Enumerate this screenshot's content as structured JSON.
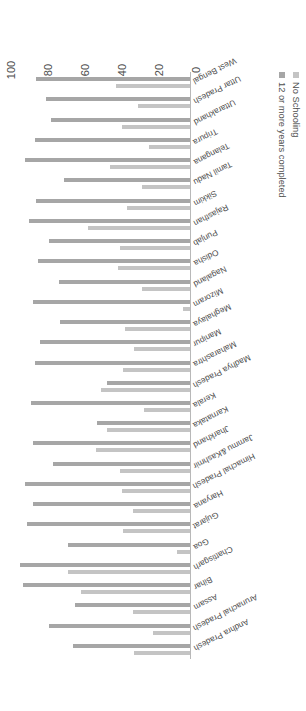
{
  "chart_data": {
    "type": "bar",
    "orientation": "horizontal",
    "title": "",
    "subtitle": "",
    "xlabel": "",
    "ylabel": "",
    "xlim": [
      0,
      100
    ],
    "ticks": [
      "0",
      "20",
      "40",
      "60",
      "80",
      "100"
    ],
    "tick_values": [
      0,
      20,
      40,
      60,
      80,
      100
    ],
    "grid": false,
    "legend_position": "bottom-left",
    "categories": [
      "Andhra Pradesh",
      "Arunachal Pradesh",
      "Assam",
      "Bihar",
      "Chattisgarh",
      "Goa",
      "Gujarat",
      "Haryana",
      "Himachal Pradesh",
      "Jammu &Kashmir",
      "Jharkhand",
      "Karnataka",
      "Kerala",
      "Madhya Pradesh",
      "Maharashtra",
      "Manipur",
      "Meghalaya",
      "Mizoram",
      "Nagaland",
      "Odisha",
      "Punjab",
      "Rajasthan",
      "Sikkim",
      "Tamil Nadu",
      "Telangana",
      "Tripura",
      "Uttarakhand",
      "Uttar Pradesh",
      "West Bengal"
    ],
    "series": [
      {
        "name": "No Schooling",
        "color": "#c4c4c4",
        "values": [
          30,
          20,
          31,
          59,
          66,
          7,
          36,
          31,
          37,
          38,
          51,
          45,
          25,
          48,
          36,
          30,
          35,
          4,
          26,
          39,
          38,
          55,
          34,
          26,
          43,
          22,
          37,
          28,
          40
        ]
      },
      {
        "name": "12  or more years completed",
        "color": "#a6a6a6",
        "values": [
          63,
          76,
          62,
          90,
          92,
          66,
          88,
          85,
          89,
          74,
          85,
          50,
          86,
          45,
          84,
          81,
          70,
          85,
          71,
          82,
          76,
          87,
          83,
          68,
          89,
          84,
          75,
          78,
          83
        ]
      }
    ]
  },
  "legend": {
    "entries": [
      {
        "label": "No Schooling",
        "color": "#c4c4c4"
      },
      {
        "label": "12  or more years completed",
        "color": "#a6a6a6"
      }
    ]
  },
  "axis": {
    "value_ticks": [
      "0",
      "20",
      "40",
      "60",
      "80",
      "100"
    ]
  }
}
